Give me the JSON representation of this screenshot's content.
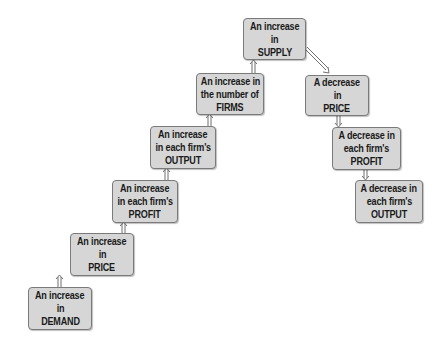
{
  "diagram": {
    "type": "flowchart",
    "boxes": [
      {
        "id": "demand_up",
        "lines": [
          "An increase",
          "in",
          "DEMAND"
        ],
        "x": 28,
        "y": 287,
        "w": 64,
        "h": 43
      },
      {
        "id": "price_up",
        "lines": [
          "An increase",
          "in",
          "PRICE"
        ],
        "x": 70,
        "y": 233,
        "w": 64,
        "h": 43
      },
      {
        "id": "profit_up",
        "lines": [
          "An increase",
          "in each firm's",
          "PROFIT"
        ],
        "x": 112,
        "y": 180,
        "w": 66,
        "h": 43
      },
      {
        "id": "output_up",
        "lines": [
          "An increase",
          "in each firm's",
          "OUTPUT"
        ],
        "x": 150,
        "y": 126,
        "w": 66,
        "h": 43
      },
      {
        "id": "firms_up",
        "lines": [
          "An increase in",
          "the number of",
          "FIRMS"
        ],
        "x": 196,
        "y": 73,
        "w": 68,
        "h": 42
      },
      {
        "id": "supply_up",
        "lines": [
          "An increase",
          "in",
          "SUPPLY"
        ],
        "x": 243,
        "y": 18,
        "w": 63,
        "h": 42
      },
      {
        "id": "price_down",
        "lines": [
          "A decrease",
          "in",
          "PRICE"
        ],
        "x": 305,
        "y": 75,
        "w": 64,
        "h": 41
      },
      {
        "id": "profit_down",
        "lines": [
          "A decrease in",
          "each firm's",
          "PROFIT"
        ],
        "x": 332,
        "y": 127,
        "w": 69,
        "h": 43
      },
      {
        "id": "output_down",
        "lines": [
          "A decrease in",
          "each firm's",
          "OUTPUT"
        ],
        "x": 355,
        "y": 180,
        "w": 68,
        "h": 43
      }
    ],
    "edges": [
      {
        "from": "demand_up",
        "to": "price_up"
      },
      {
        "from": "price_up",
        "to": "profit_up"
      },
      {
        "from": "profit_up",
        "to": "output_up"
      },
      {
        "from": "output_up",
        "to": "firms_up"
      },
      {
        "from": "firms_up",
        "to": "supply_up"
      },
      {
        "from": "supply_up",
        "to": "price_down"
      },
      {
        "from": "price_down",
        "to": "profit_down"
      },
      {
        "from": "profit_down",
        "to": "output_down"
      }
    ],
    "colors": {
      "box_fill": "#d6d6d6",
      "box_border": "#7a7a7a",
      "arrow": "#6e6e6e",
      "text": "#1a1a1a"
    }
  }
}
